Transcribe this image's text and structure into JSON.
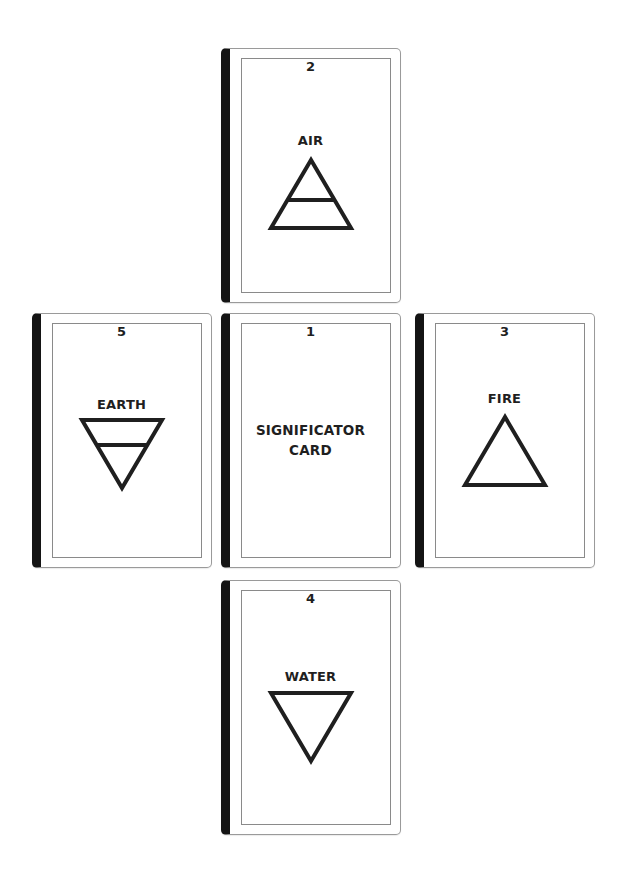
{
  "spread": {
    "cards": [
      {
        "position": 1,
        "number": "1",
        "label_line1": "SIGNIFICATOR",
        "label_line2": "CARD",
        "symbol": "none",
        "location": "center"
      },
      {
        "position": 2,
        "number": "2",
        "label": "AIR",
        "symbol": "air-triangle-icon",
        "location": "top"
      },
      {
        "position": 3,
        "number": "3",
        "label": "FIRE",
        "symbol": "fire-triangle-icon",
        "location": "right"
      },
      {
        "position": 4,
        "number": "4",
        "label": "WATER",
        "symbol": "water-triangle-icon",
        "location": "bottom"
      },
      {
        "position": 5,
        "number": "5",
        "label": "EARTH",
        "symbol": "earth-triangle-icon",
        "location": "left"
      }
    ]
  },
  "colors": {
    "card_spine": "#141414",
    "card_border": "#9a9a9a",
    "ink": "#1f1f1f",
    "background": "#ffffff"
  }
}
